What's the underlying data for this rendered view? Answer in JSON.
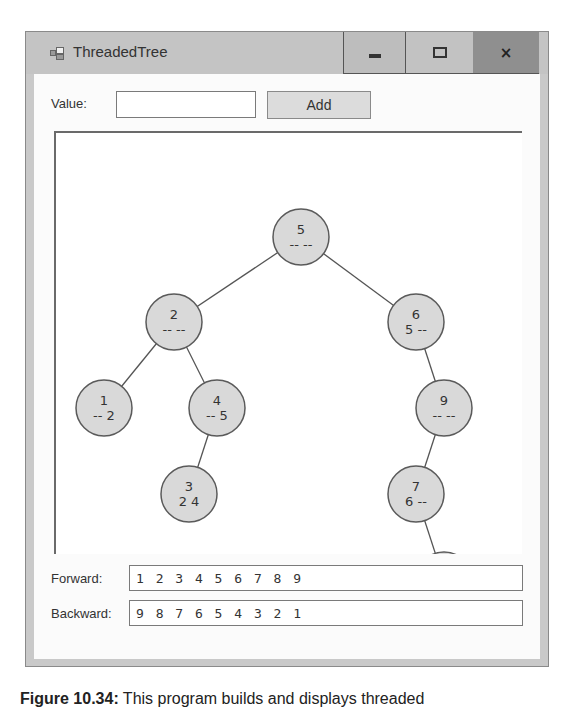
{
  "window": {
    "title": "ThreadedTree",
    "controls": {
      "minimize": "minimize",
      "maximize": "maximize",
      "close": "×"
    }
  },
  "toolbar": {
    "value_label": "Value:",
    "value_input": "",
    "add_label": "Add"
  },
  "tree": {
    "nodes": [
      {
        "value": "5",
        "threads": "-- --",
        "cx": 245,
        "cy": 104
      },
      {
        "value": "2",
        "threads": "-- --",
        "cx": 118,
        "cy": 189
      },
      {
        "value": "6",
        "threads": "5 --",
        "cx": 360,
        "cy": 189
      },
      {
        "value": "1",
        "threads": "-- 2",
        "cx": 48,
        "cy": 275
      },
      {
        "value": "4",
        "threads": "-- 5",
        "cx": 161,
        "cy": 275
      },
      {
        "value": "9",
        "threads": "-- --",
        "cx": 388,
        "cy": 275
      },
      {
        "value": "3",
        "threads": "2 4",
        "cx": 133,
        "cy": 361
      },
      {
        "value": "7",
        "threads": "6 --",
        "cx": 360,
        "cy": 361
      },
      {
        "value": "8",
        "threads": "7 9",
        "cx": 388,
        "cy": 447
      }
    ],
    "edges": [
      [
        0,
        1
      ],
      [
        0,
        2
      ],
      [
        1,
        3
      ],
      [
        1,
        4
      ],
      [
        4,
        6
      ],
      [
        2,
        5
      ],
      [
        5,
        7
      ],
      [
        7,
        8
      ]
    ]
  },
  "traversals": {
    "forward_label": "Forward:",
    "forward_value": "1 2 3 4 5 6 7 8 9",
    "backward_label": "Backward:",
    "backward_value": "9 8 7 6 5 4 3 2 1"
  },
  "caption": {
    "figure": "Figure 10.34:",
    "text": " This program builds and displays threaded"
  }
}
